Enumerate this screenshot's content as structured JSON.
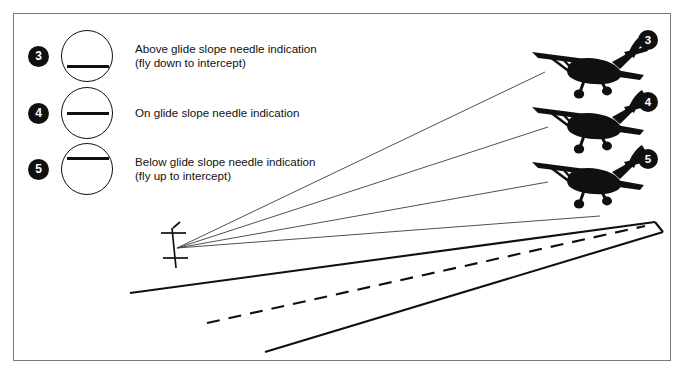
{
  "figure": {
    "background_color": "#ffffff",
    "frame_color": "#7a7a7a",
    "ink_color": "#101010"
  },
  "legend": {
    "items": [
      {
        "number": "3",
        "needle_position": "above",
        "gauge_name": "glide-slope-gauge-above",
        "text": "Above glide slope needle indication\n(fly down to intercept)"
      },
      {
        "number": "4",
        "needle_position": "on",
        "gauge_name": "glide-slope-gauge-on",
        "text": "On glide slope needle indication"
      },
      {
        "number": "5",
        "needle_position": "below",
        "gauge_name": "glide-slope-gauge-below",
        "text": "Below glide slope needle indication\n(fly up to intercept)"
      }
    ]
  },
  "aircraft": [
    {
      "label": "3",
      "position_note": "highest — above glide slope"
    },
    {
      "label": "4",
      "position_note": "middle — on glide slope"
    },
    {
      "label": "5",
      "position_note": "lowest — below glide slope"
    }
  ],
  "antenna": {
    "name": "glide-slope-antenna",
    "description": "glide slope transmitter antenna mast"
  },
  "runway": {
    "name": "runway",
    "centerline_style": "dashed",
    "edge_style": "solid"
  },
  "beams": {
    "count": 4,
    "description": "glide slope beam rays radiating from the antenna"
  }
}
